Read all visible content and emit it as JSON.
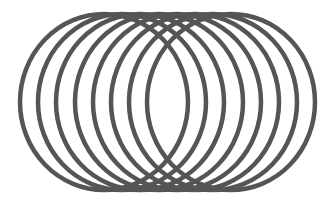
{
  "figure": {
    "stroke_color": "#555555",
    "background": "#ffffff",
    "stroke_width": 4.5,
    "ellipses": [
      {
        "cx": 104,
        "cy": 102,
        "rx": 84,
        "ry": 88
      },
      {
        "cx": 122,
        "cy": 102,
        "rx": 84,
        "ry": 88
      },
      {
        "cx": 140,
        "cy": 102,
        "rx": 84,
        "ry": 88
      },
      {
        "cx": 159,
        "cy": 102,
        "rx": 84,
        "ry": 88
      },
      {
        "cx": 177,
        "cy": 102,
        "rx": 84,
        "ry": 88
      },
      {
        "cx": 195,
        "cy": 102,
        "rx": 84,
        "ry": 88
      },
      {
        "cx": 213,
        "cy": 102,
        "rx": 84,
        "ry": 88
      },
      {
        "cx": 231,
        "cy": 102,
        "rx": 84,
        "ry": 88
      }
    ]
  }
}
